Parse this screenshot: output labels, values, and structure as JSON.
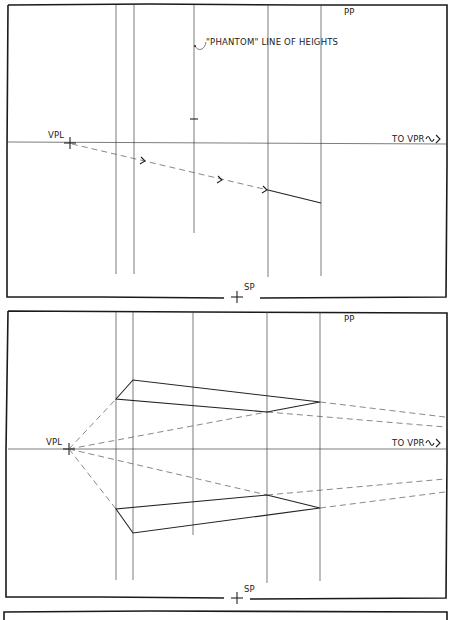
{
  "colors": {
    "ink": "#222222",
    "background": "#ffffff",
    "light_line": "#555555"
  },
  "panel1": {
    "pp_label": "PP",
    "annotation": "\"PHANTOM\" LINE OF HEIGHTS",
    "vpl_label": "VPL",
    "vpr_label": "TO VPR",
    "sp_label": "SP"
  },
  "panel2": {
    "pp_label": "PP",
    "vpl_label": "VPL",
    "vpr_label": "TO VPR",
    "sp_label": "SP"
  }
}
